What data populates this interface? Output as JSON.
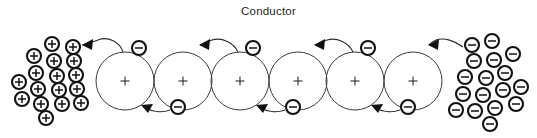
{
  "figure": {
    "title": "Conductor",
    "type": "physics-diagram",
    "background_color": "#ffffff",
    "line_color": "#2b2b2b",
    "glyph_color": "#111111"
  },
  "conductor": {
    "label": "Conductor",
    "atom_count": 6,
    "atom_radius": 29,
    "atom_center_y": 81,
    "atom_centers_x": [
      125,
      183,
      240,
      298,
      355,
      413
    ],
    "nucleus_symbol": "+",
    "nucleus_symbol_name": "positive-charge-sign"
  },
  "free_electrons": [
    {
      "id": "electron-top-1",
      "symbol": "-",
      "cx": 139,
      "cy": 48,
      "position": "above"
    },
    {
      "id": "electron-bottom-1",
      "symbol": "-",
      "cx": 178,
      "cy": 107,
      "position": "below"
    },
    {
      "id": "electron-top-2",
      "symbol": "-",
      "cx": 253,
      "cy": 48,
      "position": "above"
    },
    {
      "id": "electron-bottom-2",
      "symbol": "-",
      "cx": 293,
      "cy": 107,
      "position": "below"
    },
    {
      "id": "electron-top-3",
      "symbol": "-",
      "cx": 368,
      "cy": 48,
      "position": "above"
    },
    {
      "id": "electron-bottom-3",
      "symbol": "-",
      "cx": 408,
      "cy": 107,
      "position": "below"
    }
  ],
  "hop_arrows": [
    {
      "id": "hop-arrow-1",
      "from": "conductor-left-edge",
      "to": "positive-cluster",
      "direction": "left",
      "tip_x": 80,
      "tip_y": 45
    },
    {
      "id": "hop-arrow-2",
      "from": "electron-bottom-1",
      "to": "atom-1",
      "direction": "left",
      "tip_x": 140,
      "tip_y": 106
    },
    {
      "id": "hop-arrow-3",
      "from": "atom-3-top",
      "to": "atom-2",
      "direction": "left",
      "tip_x": 198,
      "tip_y": 45
    },
    {
      "id": "hop-arrow-4",
      "from": "electron-bottom-2",
      "to": "atom-3",
      "direction": "left",
      "tip_x": 255,
      "tip_y": 106
    },
    {
      "id": "hop-arrow-5",
      "from": "atom-5-top",
      "to": "atom-4",
      "direction": "left",
      "tip_x": 313,
      "tip_y": 45
    },
    {
      "id": "hop-arrow-6",
      "from": "electron-bottom-3",
      "to": "atom-5",
      "direction": "left",
      "tip_x": 370,
      "tip_y": 106
    },
    {
      "id": "hop-arrow-7",
      "from": "negative-cluster",
      "to": "atom-6",
      "direction": "left",
      "tip_x": 428,
      "tip_y": 45
    }
  ],
  "positive_cluster": {
    "name": "positive-charge-cluster",
    "symbol": "+",
    "count": 17,
    "charges": [
      {
        "cx": 52,
        "cy": 44
      },
      {
        "cx": 73,
        "cy": 47
      },
      {
        "cx": 34,
        "cy": 56
      },
      {
        "cx": 54,
        "cy": 61
      },
      {
        "cx": 74,
        "cy": 61
      },
      {
        "cx": 36,
        "cy": 73
      },
      {
        "cx": 57,
        "cy": 76
      },
      {
        "cx": 76,
        "cy": 75
      },
      {
        "cx": 19,
        "cy": 82
      },
      {
        "cx": 38,
        "cy": 89
      },
      {
        "cx": 59,
        "cy": 90
      },
      {
        "cx": 77,
        "cy": 89
      },
      {
        "cx": 22,
        "cy": 99
      },
      {
        "cx": 41,
        "cy": 104
      },
      {
        "cx": 62,
        "cy": 104
      },
      {
        "cx": 81,
        "cy": 103
      },
      {
        "cx": 46,
        "cy": 118
      }
    ]
  },
  "negative_cluster": {
    "name": "negative-charge-cluster",
    "symbol": "-",
    "count": 17,
    "charges": [
      {
        "cx": 472,
        "cy": 45
      },
      {
        "cx": 492,
        "cy": 41
      },
      {
        "cx": 474,
        "cy": 61
      },
      {
        "cx": 494,
        "cy": 60
      },
      {
        "cx": 513,
        "cy": 54
      },
      {
        "cx": 465,
        "cy": 77
      },
      {
        "cx": 486,
        "cy": 78
      },
      {
        "cx": 505,
        "cy": 73
      },
      {
        "cx": 463,
        "cy": 94
      },
      {
        "cx": 483,
        "cy": 95
      },
      {
        "cx": 503,
        "cy": 90
      },
      {
        "cx": 521,
        "cy": 87
      },
      {
        "cx": 456,
        "cy": 110
      },
      {
        "cx": 475,
        "cy": 111
      },
      {
        "cx": 495,
        "cy": 108
      },
      {
        "cx": 516,
        "cy": 104
      },
      {
        "cx": 490,
        "cy": 124
      }
    ]
  }
}
